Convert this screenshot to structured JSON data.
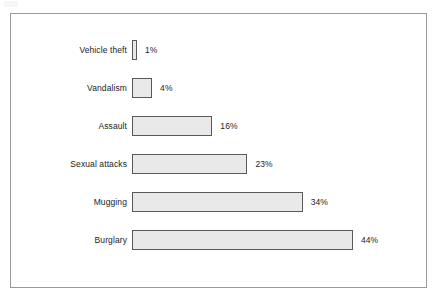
{
  "chart_data": {
    "type": "bar",
    "orientation": "horizontal",
    "title": "",
    "subtitle": "",
    "xlabel": "",
    "ylabel": "",
    "categories": [
      "Vehicle theft",
      "Vandalism",
      "Assault",
      "Sexual attacks",
      "Mugging",
      "Burglary"
    ],
    "values": [
      1,
      4,
      16,
      23,
      34,
      44
    ],
    "value_labels": [
      "1%",
      "4%",
      "16%",
      "23%",
      "34%",
      "44%"
    ],
    "unit": "%",
    "xlim": [
      0,
      44
    ],
    "grid": false,
    "legend": null,
    "annotations": [],
    "series": [
      {
        "name": "",
        "values": [
          1,
          4,
          16,
          23,
          34,
          44
        ]
      }
    ]
  },
  "style": {
    "bar_fill": "#e9e9e9",
    "bar_border": "#595959",
    "frame_border": "#9a9a9a",
    "text_color": "#1c1c1c",
    "background": "#ffffff"
  },
  "layout": {
    "px_per_percent": 5.02,
    "bar_origin_x": 131,
    "bar_height": 20,
    "row_pitch": 38,
    "first_row_top": 39
  }
}
